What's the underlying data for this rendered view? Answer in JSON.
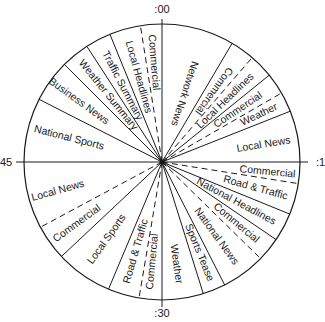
{
  "diagram": {
    "type": "radio-hour-clock",
    "center": [
      162,
      162
    ],
    "radius": 138,
    "axis_labels": [
      {
        "text": ":00",
        "x": 162,
        "y": 13,
        "anchor": "middle"
      },
      {
        "text": ":1",
        "x": 316,
        "y": 166,
        "anchor": "start"
      },
      {
        "text": ":30",
        "x": 162,
        "y": 317,
        "anchor": "middle"
      },
      {
        "text": "45",
        "x": 0,
        "y": 166,
        "anchor": "start"
      }
    ],
    "boundaries": [
      {
        "minute": 5.1,
        "style": "solid"
      },
      {
        "minute": 6.8,
        "style": "dashed"
      },
      {
        "minute": 8.5,
        "style": "solid"
      },
      {
        "minute": 10.0,
        "style": "dashed"
      },
      {
        "minute": 11.4,
        "style": "solid"
      },
      {
        "minute": 16.5,
        "style": "dashed"
      },
      {
        "minute": 18.7,
        "style": "solid"
      },
      {
        "minute": 20.7,
        "style": "solid"
      },
      {
        "minute": 22.4,
        "style": "dashed"
      },
      {
        "minute": 25.5,
        "style": "solid"
      },
      {
        "minute": 27.1,
        "style": "solid"
      },
      {
        "minute": 31.6,
        "style": "dashed"
      },
      {
        "minute": 33.8,
        "style": "solid"
      },
      {
        "minute": 37.8,
        "style": "solid"
      },
      {
        "minute": 40.3,
        "style": "dashed"
      },
      {
        "minute": 49.5,
        "style": "solid"
      },
      {
        "minute": 52.5,
        "style": "solid"
      },
      {
        "minute": 54.5,
        "style": "solid"
      },
      {
        "minute": 56.3,
        "style": "solid"
      },
      {
        "minute": 58.5,
        "style": "dashed"
      }
    ],
    "segments": [
      {
        "label": "Network News",
        "start": 0,
        "end": 5.1,
        "label_minute": 3.0,
        "label_r": 72
      },
      {
        "label": "Commercial",
        "start": 5.1,
        "end": 6.8,
        "label_minute": 6.0,
        "label_r": 88
      },
      {
        "label": "Local Headlines",
        "start": 6.8,
        "end": 8.5,
        "label_minute": 7.7,
        "label_r": 88
      },
      {
        "label": "Commercial",
        "start": 8.5,
        "end": 10.0,
        "label_minute": 9.3,
        "label_r": 92
      },
      {
        "label": "Weather",
        "start": 10.0,
        "end": 11.4,
        "label_minute": 10.7,
        "label_r": 108
      },
      {
        "label": "Local News",
        "start": 11.4,
        "end": 15,
        "label_minute": 13.4,
        "label_r": 103
      },
      {
        "label": "Commercial",
        "start": 15,
        "end": 16.5,
        "label_minute": 15.9,
        "label_r": 106
      },
      {
        "label": "Road & Traffic",
        "start": 16.5,
        "end": 18.7,
        "label_minute": 17.6,
        "label_r": 97
      },
      {
        "label": "National Headlines",
        "start": 18.7,
        "end": 20.7,
        "label_minute": 19.7,
        "label_r": 84
      },
      {
        "label": "Commercial",
        "start": 20.7,
        "end": 22.4,
        "label_minute": 21.6,
        "label_r": 96
      },
      {
        "label": "National News",
        "start": 22.4,
        "end": 25.5,
        "label_minute": 24.0,
        "label_r": 92
      },
      {
        "label": "Sports Tease",
        "start": 25.5,
        "end": 27.1,
        "label_minute": 26.3,
        "label_r": 98
      },
      {
        "label": "Weather",
        "start": 27.1,
        "end": 30,
        "label_minute": 28.7,
        "label_r": 103
      },
      {
        "label": "Commercial",
        "start": 30,
        "end": 31.6,
        "label_minute": 30.9,
        "label_r": 100
      },
      {
        "label": "Road & Traffic",
        "start": 31.6,
        "end": 33.8,
        "label_minute": 32.7,
        "label_r": 93
      },
      {
        "label": "Local Sports",
        "start": 33.8,
        "end": 37.8,
        "label_minute": 35.9,
        "label_r": 95
      },
      {
        "label": "Commercial",
        "start": 37.8,
        "end": 40.3,
        "label_minute": 39.0,
        "label_r": 105
      },
      {
        "label": "Local News",
        "start": 40.3,
        "end": 45,
        "label_minute": 42.4,
        "label_r": 108
      },
      {
        "label": "National Sports",
        "start": 45,
        "end": 49.5,
        "label_minute": 47.4,
        "label_r": 96
      },
      {
        "label": "Business News",
        "start": 49.5,
        "end": 52.5,
        "label_minute": 51.0,
        "label_r": 103
      },
      {
        "label": "Weather Summary",
        "start": 52.5,
        "end": 54.5,
        "label_minute": 53.5,
        "label_r": 86
      },
      {
        "label": "Traffic Summary",
        "start": 54.5,
        "end": 56.3,
        "label_minute": 55.4,
        "label_r": 86
      },
      {
        "label": "Local Headlines",
        "start": 56.3,
        "end": 58.5,
        "label_minute": 57.4,
        "label_r": 88
      },
      {
        "label": "Commercial",
        "start": 58.5,
        "end": 60,
        "label_minute": 59.2,
        "label_r": 100
      }
    ]
  }
}
